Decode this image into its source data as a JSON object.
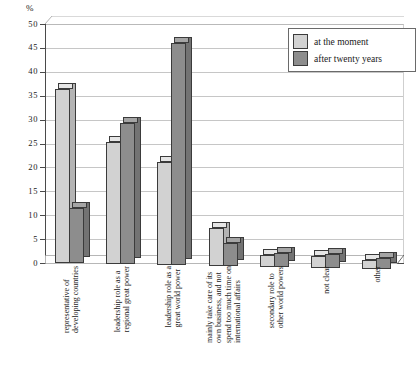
{
  "axis": {
    "unit_label": "%",
    "yticks": [
      "0",
      "5",
      "10",
      "15",
      "20",
      "25",
      "30",
      "35",
      "40",
      "45",
      "50"
    ]
  },
  "legend": {
    "items": [
      {
        "label": "at the moment",
        "color": "#d2d2d2",
        "swatch": "light"
      },
      {
        "label": "after twenty years",
        "color": "#8d8d8d",
        "swatch": "dark"
      }
    ]
  },
  "categories": [
    {
      "lines": [
        "representative of",
        "developing countries"
      ]
    },
    {
      "lines": [
        "leadership role as a",
        "regional great power"
      ]
    },
    {
      "lines": [
        "leadership role as a",
        "great world power"
      ]
    },
    {
      "lines": [
        "mainly take care of its",
        "own business, and not",
        "spend too much time on",
        "international affairs"
      ]
    },
    {
      "lines": [
        "secondary role to",
        "other world powers"
      ]
    },
    {
      "lines": [
        "not clear"
      ]
    },
    {
      "lines": [
        "other"
      ]
    }
  ],
  "chart_data": {
    "type": "bar",
    "title": "",
    "xlabel": "",
    "ylabel": "%",
    "ylim": [
      0,
      50
    ],
    "ytick_step": 5,
    "grid": true,
    "legend_position": "top-right",
    "style": "3d-clustered-column",
    "categories": [
      "representative of developing countries",
      "leadership role as a regional great power",
      "leadership role as a great world power",
      "mainly take care of its own business, and not spend too much time on international affairs",
      "secondary role to other world powers",
      "not clear",
      "other"
    ],
    "series": [
      {
        "name": "at the moment",
        "color": "#d2d2d2",
        "values": [
          36.5,
          25.5,
          21.5,
          8.0,
          2.5,
          2.5,
          2.0
        ]
      },
      {
        "name": "after twenty years",
        "color": "#8d8d8d",
        "values": [
          11.5,
          29.5,
          46.5,
          5.0,
          3.0,
          3.0,
          2.5
        ]
      }
    ]
  }
}
